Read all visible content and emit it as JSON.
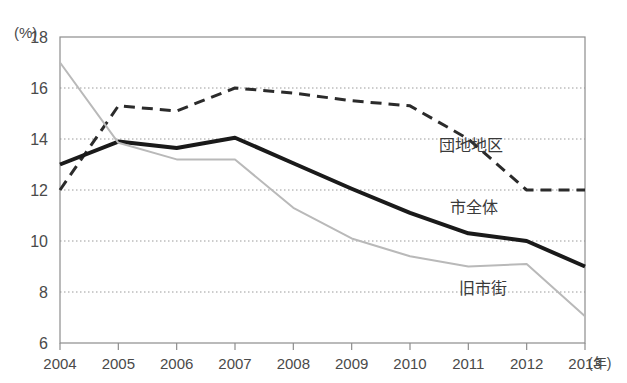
{
  "chart_data": {
    "type": "line",
    "title": "",
    "subtitle": "",
    "xlabel": "年",
    "ylabel": "(%)",
    "ylim": [
      6,
      18
    ],
    "xlim": [
      2004,
      2013
    ],
    "grid": true,
    "grid_values": [
      8,
      10,
      12,
      14,
      16
    ],
    "y_ticks": [
      18,
      16,
      14,
      12,
      10,
      8,
      6
    ],
    "y_tick_labels": [
      "18",
      "16",
      "14",
      "12",
      "10",
      "8",
      "6"
    ],
    "x": [
      2004,
      2005,
      2006,
      2007,
      2008,
      2009,
      2010,
      2011,
      2012,
      2013
    ],
    "x_tick_labels": [
      "2004",
      "2005",
      "2006",
      "2007",
      "2008",
      "2009",
      "2010",
      "2011",
      "2012",
      "2013"
    ],
    "x_unit_label": "(年)",
    "legend_position": "inline-right",
    "series": [
      {
        "name": "団地地区",
        "style": "dashed",
        "color": "#2b2b2b",
        "width": 3,
        "values": [
          12.0,
          15.3,
          15.1,
          16.0,
          15.8,
          15.5,
          15.3,
          14.0,
          12.0,
          12.0
        ],
        "label_x": 2011.05,
        "label_y": 13.75
      },
      {
        "name": "市全体",
        "style": "solid",
        "color": "#1a1a1a",
        "width": 4,
        "values": [
          13.0,
          13.9,
          13.65,
          14.05,
          13.05,
          12.05,
          11.1,
          10.3,
          10.0,
          9.0
        ],
        "label_x": 2011.1,
        "label_y": 11.35
      },
      {
        "name": "旧市街",
        "style": "solid",
        "color": "#b9b9b9",
        "width": 2,
        "values": [
          17.0,
          13.85,
          13.2,
          13.2,
          11.3,
          10.1,
          9.4,
          9.0,
          9.1,
          7.05
        ],
        "label_x": 2011.25,
        "label_y": 8.15
      }
    ]
  },
  "figure": {
    "plot_left": 60,
    "plot_right": 585,
    "plot_top": 37,
    "plot_bottom": 343,
    "frame_color": "#8d8d8d",
    "grid_color": "#9a9a9a",
    "background": "#ffffff"
  }
}
